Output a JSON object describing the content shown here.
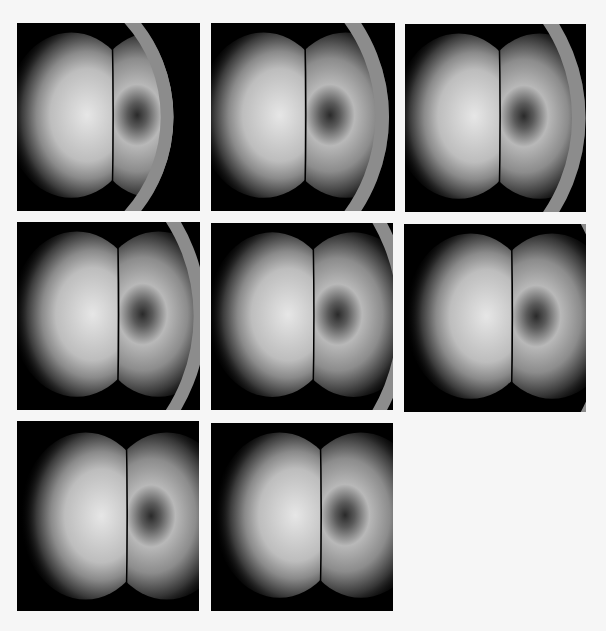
{
  "figure": {
    "background": "#f6f6f6",
    "panel_background": "#000000",
    "ring_color": "#8c8c8c",
    "lobe_colors": {
      "left_core": "#e6e6e6",
      "right_core": "#b8b8b8",
      "edge": "#000000"
    },
    "panels": [
      {
        "id": 1,
        "x": 17,
        "y": 23,
        "w": 183,
        "h": 188,
        "lobe_cx": 0.52,
        "lobe_cy": 0.49,
        "ring": {
          "cx": 0.02,
          "cy": 0.5,
          "r": 0.8,
          "width": 0.07
        }
      },
      {
        "id": 2,
        "x": 211,
        "y": 23,
        "w": 184,
        "h": 188,
        "lobe_cx": 0.51,
        "lobe_cy": 0.49,
        "ring": {
          "cx": 0.03,
          "cy": 0.5,
          "r": 0.9,
          "width": 0.075
        }
      },
      {
        "id": 3,
        "x": 405,
        "y": 24,
        "w": 181,
        "h": 188,
        "lobe_cx": 0.52,
        "lobe_cy": 0.49,
        "ring": {
          "cx": 0.0,
          "cy": 0.5,
          "r": 0.96,
          "width": 0.075
        }
      },
      {
        "id": 4,
        "x": 17,
        "y": 222,
        "w": 183,
        "h": 188,
        "lobe_cx": 0.55,
        "lobe_cy": 0.49,
        "ring": {
          "cx": 0.02,
          "cy": 0.5,
          "r": 0.98,
          "width": 0.07
        }
      },
      {
        "id": 5,
        "x": 211,
        "y": 223,
        "w": 182,
        "h": 187,
        "lobe_cx": 0.56,
        "lobe_cy": 0.49,
        "ring": {
          "cx": 0.0,
          "cy": 0.5,
          "r": 1.06,
          "width": 0.07
        }
      },
      {
        "id": 6,
        "x": 404,
        "y": 224,
        "w": 182,
        "h": 188,
        "lobe_cx": 0.59,
        "lobe_cy": 0.49,
        "ring": {
          "cx": 0.0,
          "cy": 0.5,
          "r": 1.15,
          "width": 0.1
        }
      },
      {
        "id": 7,
        "x": 17,
        "y": 421,
        "w": 182,
        "h": 190,
        "lobe_cx": 0.6,
        "lobe_cy": 0.5,
        "ring": {
          "cx": 0.0,
          "cy": 0.5,
          "r": 1.28,
          "width": 0.1
        }
      },
      {
        "id": 8,
        "x": 211,
        "y": 423,
        "w": 182,
        "h": 188,
        "lobe_cx": 0.6,
        "lobe_cy": 0.49,
        "ring": null
      }
    ]
  }
}
